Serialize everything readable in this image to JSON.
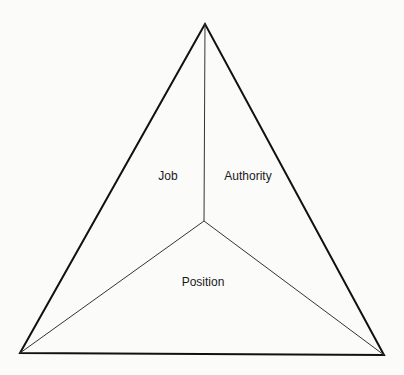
{
  "diagram": {
    "type": "triangle-divided",
    "vertices": {
      "top": [
        205,
        24
      ],
      "bottom_left": [
        20,
        353
      ],
      "bottom_right": [
        384,
        355
      ],
      "center": [
        204,
        221
      ]
    },
    "regions": [
      {
        "id": "job",
        "label": "Job",
        "x": 168,
        "y": 180
      },
      {
        "id": "authority",
        "label": "Authority",
        "x": 248,
        "y": 180
      },
      {
        "id": "position",
        "label": "Position",
        "x": 203,
        "y": 286
      }
    ],
    "colors": {
      "outline": "#111111",
      "inner_lines": "#333333",
      "background": "#fbfbfa"
    }
  }
}
